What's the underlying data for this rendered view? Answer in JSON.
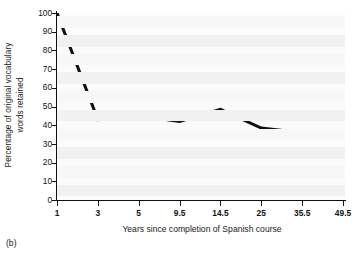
{
  "caption": "(b)",
  "chart_data": {
    "type": "line",
    "title": "",
    "xlabel": "Years since completion of Spanish course",
    "ylabel_line1": "Percentage of original vocabulary",
    "ylabel_line2": "words retained",
    "categories": [
      "1",
      "3",
      "5",
      "9.5",
      "14.5",
      "25",
      "35.5",
      "49.5"
    ],
    "values": [
      100,
      43,
      45,
      42,
      48.5,
      38.5,
      36,
      33.5
    ],
    "ylim": [
      0,
      100
    ],
    "ytick_values": [
      0,
      10,
      20,
      30,
      40,
      50,
      60,
      70,
      80,
      90,
      100
    ],
    "ytick_labels": [
      "0",
      "10",
      "20",
      "30",
      "40",
      "50",
      "60",
      "70",
      "80",
      "90",
      "100"
    ],
    "grid": "horizontal-bands",
    "legend": "none",
    "line_color": "#111111",
    "line_width_px": 3,
    "plot_background": "#fbfbfb",
    "band_color": "#f1f1f1",
    "axis_color": "#111111"
  }
}
